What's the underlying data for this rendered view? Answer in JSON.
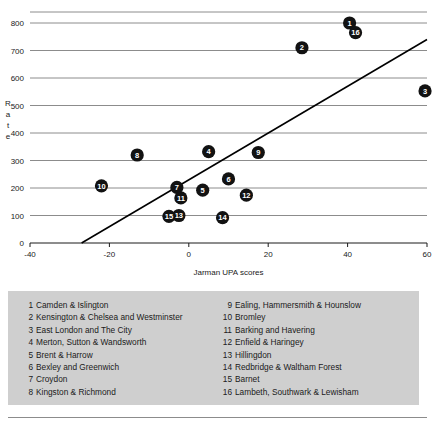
{
  "chart_data": {
    "type": "scatter",
    "title": "",
    "xlabel": "Jarman UPA scores",
    "ylabel": "Rate",
    "xlim": [
      -40,
      60
    ],
    "ylim": [
      0,
      800
    ],
    "xticks": [
      -40,
      -20,
      0,
      20,
      40,
      60
    ],
    "yticks": [
      0,
      100,
      200,
      300,
      400,
      500,
      600,
      700,
      800
    ],
    "grid": true,
    "legend_position": "below-chart",
    "points": [
      {
        "label": "1",
        "x": 40.5,
        "y": 800,
        "name": "Camden & Islington"
      },
      {
        "label": "2",
        "x": 28.5,
        "y": 710,
        "name": "Kensington & Chelsea and Westminster"
      },
      {
        "label": "3",
        "x": 59.5,
        "y": 553,
        "name": "East London and The City"
      },
      {
        "label": "4",
        "x": 5.0,
        "y": 332,
        "name": "Merton, Sutton & Wandsworth"
      },
      {
        "label": "5",
        "x": 3.5,
        "y": 192,
        "name": "Brent & Harrow"
      },
      {
        "label": "6",
        "x": 10.0,
        "y": 233,
        "name": "Bexley and Greenwich"
      },
      {
        "label": "7",
        "x": -3.0,
        "y": 202,
        "name": "Croydon"
      },
      {
        "label": "8",
        "x": -13.0,
        "y": 320,
        "name": "Kingston & Richmond"
      },
      {
        "label": "9",
        "x": 17.5,
        "y": 329,
        "name": "Ealing, Hammersmith & Hounslow"
      },
      {
        "label": "10",
        "x": -22.0,
        "y": 208,
        "name": "Bromley"
      },
      {
        "label": "11",
        "x": -2.0,
        "y": 164,
        "name": "Barking and Havering"
      },
      {
        "label": "12",
        "x": 14.5,
        "y": 174,
        "name": "Enfield & Haringey"
      },
      {
        "label": "13",
        "x": -2.5,
        "y": 100,
        "name": "Hillingdon"
      },
      {
        "label": "14",
        "x": 8.5,
        "y": 92,
        "name": "Redbridge & Waltham Forest"
      },
      {
        "label": "15",
        "x": -5.0,
        "y": 97,
        "name": "Barnet"
      },
      {
        "label": "16",
        "x": 42.0,
        "y": 765,
        "name": "Lambeth, Southwark & Lewisham"
      }
    ],
    "trend_line": {
      "x_start": -27.0,
      "y_start": 0,
      "x_end": 60.0,
      "y_end": 740
    },
    "colors": {
      "marker": "#121212",
      "marker_text": "#ffffff",
      "trend_line": "#000000",
      "gridline": "#8c8c8c",
      "legend_background": "#cfcfcf",
      "text": "#1a1a1a"
    }
  },
  "legend": {
    "left_column": [
      {
        "num": "1",
        "name": "Camden & Islington"
      },
      {
        "num": "2",
        "name": "Kensington & Chelsea and Westminster"
      },
      {
        "num": "3",
        "name": "East London and The City"
      },
      {
        "num": "4",
        "name": "Merton, Sutton & Wandsworth"
      },
      {
        "num": "5",
        "name": "Brent & Harrow"
      },
      {
        "num": "6",
        "name": "Bexley and Greenwich"
      },
      {
        "num": "7",
        "name": "Croydon"
      },
      {
        "num": "8",
        "name": "Kingston & Richmond"
      }
    ],
    "right_column": [
      {
        "num": "9",
        "name": "Ealing, Hammersmith & Hounslow"
      },
      {
        "num": "10",
        "name": "Bromley"
      },
      {
        "num": "11",
        "name": "Barking and Havering"
      },
      {
        "num": "12",
        "name": "Enfield & Haringey"
      },
      {
        "num": "13",
        "name": "Hillingdon"
      },
      {
        "num": "14",
        "name": "Redbridge & Waltham Forest"
      },
      {
        "num": "15",
        "name": "Barnet"
      },
      {
        "num": "16",
        "name": "Lambeth, Southwark & Lewisham"
      }
    ]
  },
  "ylabel_chars": [
    "R",
    "a",
    "t",
    "e"
  ]
}
